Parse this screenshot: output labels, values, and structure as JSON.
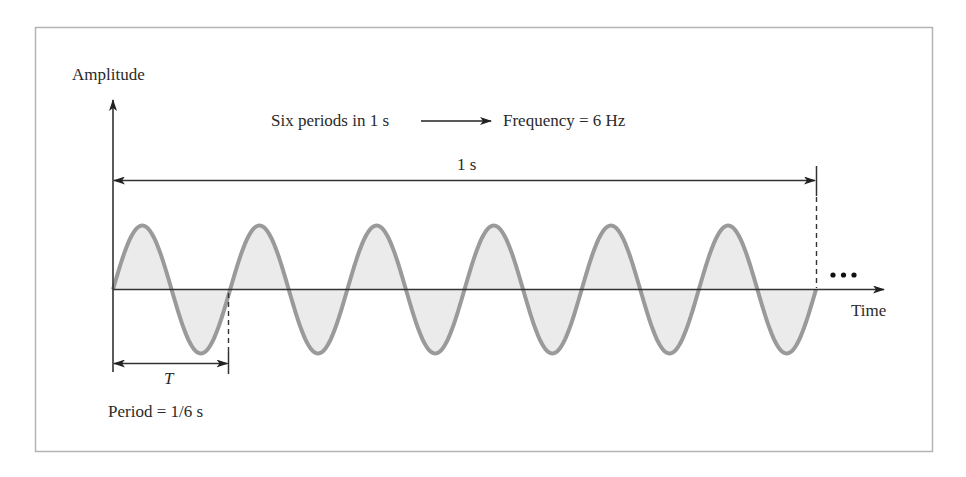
{
  "diagram": {
    "y_axis_label": "Amplitude",
    "x_axis_label": "Time",
    "headline": {
      "left": "Six periods in 1 s",
      "right": "Frequency = 6 Hz"
    },
    "span_label": "1 s",
    "period_symbol": "T",
    "period_label": "Period = 1/6 s",
    "continuation": "•••",
    "colors": {
      "frame": "#b4b4b4",
      "axis": "#333333",
      "wave_stroke": "#9a9a9a",
      "wave_fill": "#ebebeb"
    },
    "wave": {
      "cycles": 6,
      "duration_s": 1,
      "frequency_hz": 6,
      "period_s": "1/6"
    }
  }
}
